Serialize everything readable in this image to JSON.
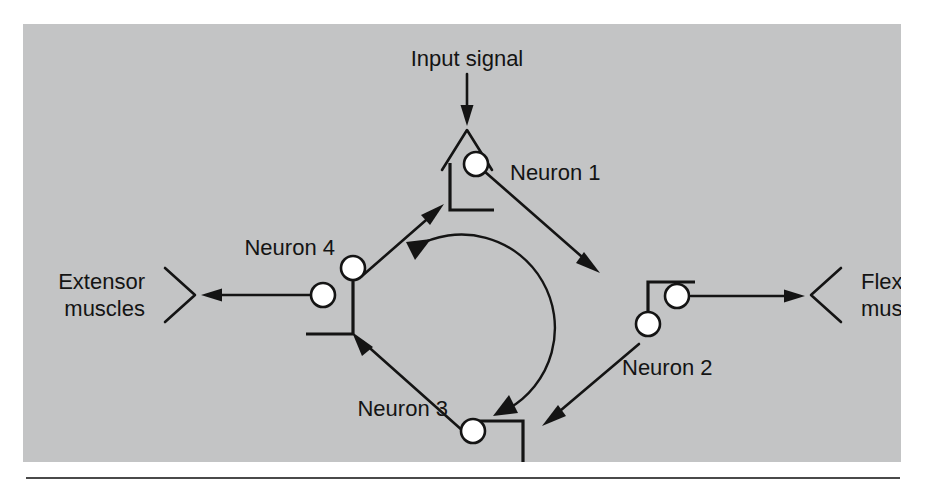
{
  "figure": {
    "kind": "neural-circuit-diagram",
    "panel_color": "#c3c4c5",
    "ink_color": "#141414",
    "synapse_fill": "#ffffff"
  },
  "labels": {
    "input_signal": "Input signal",
    "neuron_1": "Neuron 1",
    "neuron_2": "Neuron 2",
    "neuron_3": "Neuron 3",
    "neuron_4": "Neuron 4",
    "extensor_line1": "Extensor",
    "extensor_line2": "muscles",
    "flexor_line1": "Flexor",
    "flexor_line2": "muscles"
  },
  "nodes": [
    {
      "id": "neuron-1",
      "label": "Neuron 1",
      "position": "top",
      "synapse_count": 1
    },
    {
      "id": "neuron-2",
      "label": "Neuron 2",
      "position": "right",
      "synapse_count": 2
    },
    {
      "id": "neuron-3",
      "label": "Neuron 3",
      "position": "bottom",
      "synapse_count": 1
    },
    {
      "id": "neuron-4",
      "label": "Neuron 4",
      "position": "left",
      "synapse_count": 2
    }
  ],
  "connections": [
    {
      "from": "input-signal",
      "to": "neuron-1",
      "direction": "down"
    },
    {
      "from": "neuron-1",
      "to": "neuron-2",
      "direction": "down-right"
    },
    {
      "from": "neuron-2",
      "to": "neuron-3",
      "direction": "down-left"
    },
    {
      "from": "neuron-3",
      "to": "neuron-4",
      "direction": "up-left"
    },
    {
      "from": "neuron-4",
      "to": "neuron-1",
      "direction": "up-right"
    },
    {
      "from": "neuron-2",
      "to": "flexor-muscles",
      "direction": "right"
    },
    {
      "from": "neuron-4",
      "to": "extensor-muscles",
      "direction": "left"
    }
  ],
  "loop": {
    "description": "central circular arrow showing clockwise reverberation",
    "rotation": "clockwise",
    "arrowhead_count": 2
  }
}
